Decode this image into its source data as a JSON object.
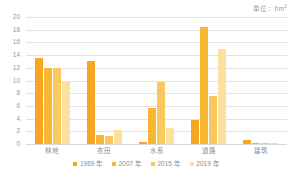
{
  "unit_caption": "单位：hm",
  "unit_superscript": "2",
  "chart_data": {
    "type": "bar",
    "title": "",
    "subtitle": "",
    "xlabel": "",
    "ylabel": "",
    "unit": "hm²",
    "ylim": [
      0,
      20
    ],
    "yticks": [
      0,
      2,
      4,
      6,
      8,
      10,
      12,
      14,
      16,
      18,
      20
    ],
    "grid": true,
    "legend_position": "bottom",
    "categories": [
      "林地",
      "农田",
      "水系",
      "道路",
      "建筑"
    ],
    "series": [
      {
        "name": "1969 年",
        "color": "#F5A623",
        "values": [
          13.5,
          13.1,
          0.3,
          3.8,
          0.7
        ]
      },
      {
        "name": "2007 年",
        "color": "#F7B733",
        "values": [
          12.0,
          1.4,
          5.6,
          18.5,
          0.2
        ]
      },
      {
        "name": "2015 年",
        "color": "#FAC85C",
        "values": [
          12.0,
          1.3,
          9.7,
          7.5,
          0.15
        ]
      },
      {
        "name": "2019 年",
        "color": "#FBE0A0",
        "values": [
          10.0,
          2.2,
          2.5,
          15.0,
          0.15
        ]
      }
    ]
  }
}
